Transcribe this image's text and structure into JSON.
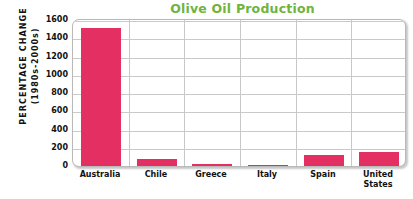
{
  "chart_data": {
    "type": "bar",
    "title": "Olive Oil Production",
    "xlabel": "",
    "ylabel_line1": "PERCENTAGE CHANGE",
    "ylabel_line2": "(1980s-2000s)",
    "categories": [
      "Australia",
      "Chile",
      "Greece",
      "Italy",
      "Spain",
      "United States"
    ],
    "category_lines": [
      [
        "Australia"
      ],
      [
        "Chile"
      ],
      [
        "Greece"
      ],
      [
        "Italy"
      ],
      [
        "Spain"
      ],
      [
        "United",
        "States"
      ]
    ],
    "values": [
      1520,
      88,
      30,
      15,
      130,
      160
    ],
    "ylim": [
      0,
      1600
    ],
    "yticks": [
      0,
      200,
      400,
      600,
      800,
      1000,
      1200,
      1400,
      1600
    ],
    "ytick_labels": [
      "0",
      "200",
      "400",
      "600",
      "800",
      "1000",
      "1200",
      "1400",
      "1600"
    ],
    "grid": true,
    "legend": "none",
    "series_color": "#e32f61",
    "title_color": "#6eb43f",
    "gridline_color": "#c9c9c9",
    "frame_color": "#b9b9b9",
    "background": "#ffffff"
  }
}
